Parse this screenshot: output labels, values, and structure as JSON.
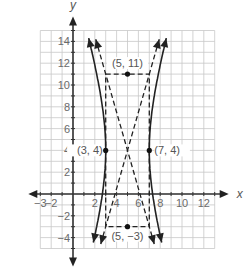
{
  "chart_data": {
    "type": "line",
    "title": "",
    "xlabel": "x",
    "ylabel": "y",
    "xlim": [
      -3,
      13
    ],
    "ylim": [
      -5,
      15
    ],
    "grid": true,
    "x_ticks": [
      -3,
      -2,
      2,
      4,
      6,
      8,
      10,
      12
    ],
    "y_ticks": [
      -4,
      -2,
      2,
      4,
      6,
      8,
      10,
      12,
      14
    ],
    "x_tick_labels": [
      "−3",
      "−2",
      "2",
      "4",
      "6",
      "8",
      "10",
      "12"
    ],
    "y_tick_labels": [
      "−4",
      "−2",
      "2",
      "4",
      "6",
      "8",
      "10",
      "12",
      "14"
    ],
    "series": [
      {
        "name": "hyperbola-left-branch",
        "style": "solid",
        "vertex": [
          3,
          4
        ],
        "description": "opens left, from (0,15) through (3,4) to (1.5,-5)"
      },
      {
        "name": "hyperbola-right-branch",
        "style": "solid",
        "vertex": [
          7,
          4
        ],
        "description": "opens right, from (9,14) through (7,4) to (8.5,-5)"
      },
      {
        "name": "asymptote-1",
        "style": "dashed",
        "points": [
          [
            2.3,
            14
          ],
          [
            7.7,
            -5
          ]
        ]
      },
      {
        "name": "asymptote-2",
        "style": "dashed",
        "points": [
          [
            2.3,
            -5
          ],
          [
            7.7,
            14
          ]
        ]
      },
      {
        "name": "box-top",
        "style": "dashed",
        "points": [
          [
            3,
            11
          ],
          [
            7,
            11
          ]
        ]
      },
      {
        "name": "box-bottom",
        "style": "dashed",
        "points": [
          [
            3,
            -3
          ],
          [
            7,
            -3
          ]
        ]
      },
      {
        "name": "box-left",
        "style": "dashed",
        "points": [
          [
            3,
            11
          ],
          [
            3,
            -3
          ]
        ]
      },
      {
        "name": "box-right",
        "style": "dashed",
        "points": [
          [
            7,
            11
          ],
          [
            7,
            -3
          ]
        ]
      }
    ],
    "annotations": [
      {
        "label": "(3, 4)",
        "point": [
          3,
          4
        ]
      },
      {
        "label": "(7, 4)",
        "point": [
          7,
          4
        ]
      },
      {
        "label": "(5, 11)",
        "point": [
          5,
          11
        ]
      },
      {
        "label": "(5, −3)",
        "point": [
          5,
          -3
        ]
      }
    ]
  }
}
